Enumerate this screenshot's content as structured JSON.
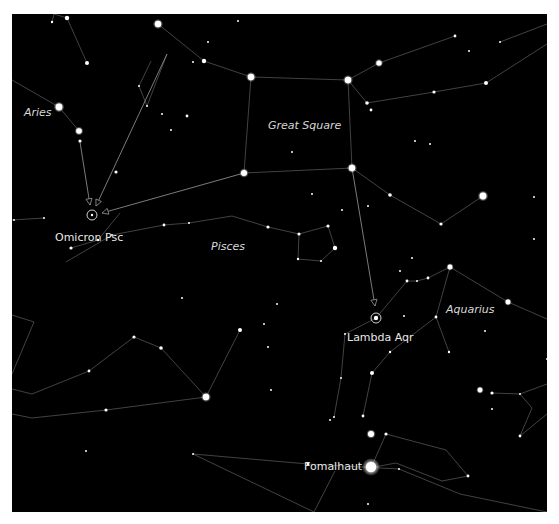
{
  "colors": {
    "background": "#000000",
    "frame": "#ffffff",
    "line": "#6e6e6e",
    "star": "#ffffff",
    "label": "#e6e6e6",
    "pointer": "#9a9a9a"
  },
  "labels": {
    "constellations": [
      {
        "id": "aries",
        "text": "Aries",
        "x": 24,
        "y": 107
      },
      {
        "id": "great-square",
        "text": "Great Square",
        "x": 256,
        "y": 106
      },
      {
        "id": "pisces",
        "text": "Pisces",
        "x": 199,
        "y": 227
      },
      {
        "id": "aquarius",
        "text": "Aquarius",
        "x": 434,
        "y": 290
      }
    ],
    "stars": [
      {
        "id": "omicron-psc",
        "text": "Omicron Psc",
        "x": 43,
        "y": 218
      },
      {
        "id": "lambda-aqr",
        "text": "Lambda Aqr",
        "x": 335,
        "y": 318
      },
      {
        "id": "fomalhaut",
        "text": "Fomalhaut",
        "x": 292,
        "y": 434
      }
    ]
  },
  "targets": [
    {
      "id": "omicron-psc",
      "x": 80,
      "y": 201
    },
    {
      "id": "lambda-aqr",
      "x": 364,
      "y": 304
    }
  ],
  "pointers": [
    {
      "from": [
        68,
        128
      ],
      "to": [
        78,
        191
      ]
    },
    {
      "from": [
        232,
        159
      ],
      "to": [
        90,
        199
      ]
    },
    {
      "from": [
        340,
        154
      ],
      "to": [
        363,
        292
      ]
    },
    {
      "from": [
        155,
        40
      ],
      "to": [
        84,
        192
      ]
    }
  ],
  "lines": [
    [
      [
        42,
        0
      ],
      [
        55,
        4
      ],
      [
        75,
        49
      ]
    ],
    [
      [
        42,
        0
      ],
      [
        40,
        8
      ]
    ],
    [
      [
        146,
        10
      ],
      [
        192,
        47
      ],
      [
        239,
        63
      ],
      [
        336,
        66
      ]
    ],
    [
      [
        336,
        66
      ],
      [
        367,
        49
      ],
      [
        443,
        22
      ]
    ],
    [
      [
        336,
        66
      ],
      [
        355,
        89
      ],
      [
        422,
        78
      ],
      [
        474,
        69
      ]
    ],
    [
      [
        474,
        69
      ],
      [
        535,
        30
      ]
    ],
    [
      [
        488,
        28
      ],
      [
        535,
        10
      ]
    ],
    [
      [
        239,
        63
      ],
      [
        232,
        159
      ]
    ],
    [
      [
        336,
        66
      ],
      [
        340,
        154
      ]
    ],
    [
      [
        232,
        159
      ],
      [
        340,
        154
      ]
    ],
    [
      [
        340,
        154
      ],
      [
        378,
        181
      ],
      [
        429,
        210
      ],
      [
        471,
        182
      ]
    ],
    [
      [
        0,
        66
      ],
      [
        47,
        93
      ],
      [
        67,
        117
      ]
    ],
    [
      [
        139,
        47
      ],
      [
        127,
        72
      ],
      [
        135,
        92
      ],
      [
        155,
        40
      ]
    ],
    [
      [
        0,
        206
      ],
      [
        32,
        204
      ]
    ],
    [
      [
        100,
        221
      ],
      [
        152,
        211
      ],
      [
        177,
        209
      ],
      [
        220,
        202
      ],
      [
        256,
        213
      ],
      [
        287,
        220
      ],
      [
        316,
        212
      ]
    ],
    [
      [
        287,
        220
      ],
      [
        286,
        245
      ],
      [
        309,
        247
      ],
      [
        323,
        234
      ],
      [
        316,
        212
      ]
    ],
    [
      [
        59,
        234
      ],
      [
        86,
        226
      ],
      [
        108,
        199
      ]
    ],
    [
      [
        100,
        221
      ],
      [
        54,
        248
      ]
    ],
    [
      [
        0,
        301
      ],
      [
        22,
        308
      ],
      [
        0,
        360
      ]
    ],
    [
      [
        0,
        375
      ],
      [
        20,
        380
      ],
      [
        77,
        357
      ],
      [
        122,
        323
      ],
      [
        149,
        334
      ],
      [
        194,
        383
      ],
      [
        228,
        316
      ]
    ],
    [
      [
        0,
        400
      ],
      [
        20,
        404
      ],
      [
        94,
        396
      ],
      [
        194,
        383
      ]
    ],
    [
      [
        364,
        304
      ],
      [
        395,
        267
      ],
      [
        405,
        267
      ],
      [
        416,
        264
      ],
      [
        438,
        253
      ],
      [
        496,
        288
      ],
      [
        535,
        305
      ]
    ],
    [
      [
        438,
        253
      ],
      [
        424,
        303
      ],
      [
        437,
        338
      ]
    ],
    [
      [
        424,
        303
      ],
      [
        378,
        338
      ],
      [
        360,
        359
      ],
      [
        351,
        402
      ]
    ],
    [
      [
        364,
        304
      ],
      [
        333,
        320
      ],
      [
        329,
        364
      ],
      [
        322,
        403
      ]
    ],
    [
      [
        508,
        380
      ],
      [
        535,
        370
      ]
    ],
    [
      [
        480,
        379
      ],
      [
        508,
        380
      ],
      [
        520,
        394
      ],
      [
        508,
        422
      ]
    ],
    [
      [
        508,
        422
      ],
      [
        535,
        400
      ]
    ],
    [
      [
        357,
        454
      ],
      [
        384,
        449
      ],
      [
        430,
        467
      ],
      [
        456,
        462
      ],
      [
        434,
        436
      ],
      [
        374,
        420
      ],
      [
        359,
        454
      ]
    ],
    [
      [
        181,
        440
      ],
      [
        296,
        450
      ],
      [
        387,
        455
      ],
      [
        448,
        480
      ],
      [
        535,
        498
      ]
    ],
    [
      [
        181,
        440
      ],
      [
        302,
        498
      ]
    ],
    [
      [
        302,
        498
      ],
      [
        323,
        457
      ]
    ]
  ],
  "stars": [
    {
      "x": 55,
      "y": 4,
      "r": 2.2
    },
    {
      "x": 146,
      "y": 10,
      "r": 3.2
    },
    {
      "x": 75,
      "y": 49,
      "r": 2.0
    },
    {
      "x": 40,
      "y": 8,
      "r": 1.2
    },
    {
      "x": 192,
      "y": 47,
      "r": 2.2
    },
    {
      "x": 239,
      "y": 63,
      "r": 3.2
    },
    {
      "x": 336,
      "y": 66,
      "r": 3.2
    },
    {
      "x": 367,
      "y": 49,
      "r": 2.6
    },
    {
      "x": 443,
      "y": 22,
      "r": 1.4
    },
    {
      "x": 355,
      "y": 89,
      "r": 1.8
    },
    {
      "x": 359,
      "y": 96,
      "r": 1.4
    },
    {
      "x": 422,
      "y": 78,
      "r": 1.6
    },
    {
      "x": 474,
      "y": 69,
      "r": 2.0
    },
    {
      "x": 488,
      "y": 28,
      "r": 1.0
    },
    {
      "x": 232,
      "y": 159,
      "r": 3.0
    },
    {
      "x": 340,
      "y": 154,
      "r": 3.2
    },
    {
      "x": 378,
      "y": 181,
      "r": 1.8
    },
    {
      "x": 429,
      "y": 210,
      "r": 1.6
    },
    {
      "x": 471,
      "y": 182,
      "r": 3.4
    },
    {
      "x": 47,
      "y": 93,
      "r": 3.4
    },
    {
      "x": 67,
      "y": 117,
      "r": 2.8
    },
    {
      "x": 68,
      "y": 127,
      "r": 1.6
    },
    {
      "x": 104,
      "y": 158,
      "r": 1.6
    },
    {
      "x": 127,
      "y": 72,
      "r": 1.0
    },
    {
      "x": 135,
      "y": 92,
      "r": 1.0
    },
    {
      "x": 150,
      "y": 100,
      "r": 1.0
    },
    {
      "x": 175,
      "y": 102,
      "r": 1.4
    },
    {
      "x": 159,
      "y": 116,
      "r": 1.0
    },
    {
      "x": 181,
      "y": 48,
      "r": 1.0
    },
    {
      "x": 226,
      "y": 7,
      "r": 1.0
    },
    {
      "x": 196,
      "y": 28,
      "r": 1.0
    },
    {
      "x": 152,
      "y": 211,
      "r": 1.4
    },
    {
      "x": 177,
      "y": 209,
      "r": 1.0
    },
    {
      "x": 256,
      "y": 213,
      "r": 1.6
    },
    {
      "x": 287,
      "y": 220,
      "r": 1.6
    },
    {
      "x": 316,
      "y": 212,
      "r": 1.6
    },
    {
      "x": 323,
      "y": 234,
      "r": 2.2
    },
    {
      "x": 286,
      "y": 245,
      "r": 1.2
    },
    {
      "x": 309,
      "y": 247,
      "r": 1.0
    },
    {
      "x": 86,
      "y": 226,
      "r": 1.2
    },
    {
      "x": 59,
      "y": 234,
      "r": 1.6
    },
    {
      "x": 32,
      "y": 204,
      "r": 1.0
    },
    {
      "x": 2,
      "y": 206,
      "r": 1.0
    },
    {
      "x": 100,
      "y": 221,
      "r": 1.0
    },
    {
      "x": 122,
      "y": 323,
      "r": 1.6
    },
    {
      "x": 149,
      "y": 334,
      "r": 1.8
    },
    {
      "x": 77,
      "y": 357,
      "r": 1.4
    },
    {
      "x": 194,
      "y": 383,
      "r": 3.2
    },
    {
      "x": 228,
      "y": 316,
      "r": 2.0
    },
    {
      "x": 94,
      "y": 396,
      "r": 1.6
    },
    {
      "x": 74,
      "y": 437,
      "r": 1.0
    },
    {
      "x": 170,
      "y": 284,
      "r": 1.0
    },
    {
      "x": 252,
      "y": 310,
      "r": 1.0
    },
    {
      "x": 256,
      "y": 333,
      "r": 1.0
    },
    {
      "x": 259,
      "y": 376,
      "r": 1.0
    },
    {
      "x": 265,
      "y": 290,
      "r": 1.0
    },
    {
      "x": 395,
      "y": 267,
      "r": 1.4
    },
    {
      "x": 405,
      "y": 267,
      "r": 1.0
    },
    {
      "x": 416,
      "y": 264,
      "r": 1.4
    },
    {
      "x": 438,
      "y": 253,
      "r": 2.4
    },
    {
      "x": 496,
      "y": 288,
      "r": 2.4
    },
    {
      "x": 424,
      "y": 303,
      "r": 1.4
    },
    {
      "x": 437,
      "y": 338,
      "r": 1.2
    },
    {
      "x": 378,
      "y": 338,
      "r": 1.2
    },
    {
      "x": 360,
      "y": 359,
      "r": 2.0
    },
    {
      "x": 351,
      "y": 402,
      "r": 1.4
    },
    {
      "x": 333,
      "y": 320,
      "r": 1.0
    },
    {
      "x": 329,
      "y": 364,
      "r": 1.0
    },
    {
      "x": 322,
      "y": 403,
      "r": 1.0
    },
    {
      "x": 318,
      "y": 406,
      "r": 1.0
    },
    {
      "x": 468,
      "y": 376,
      "r": 2.4
    },
    {
      "x": 480,
      "y": 379,
      "r": 1.6
    },
    {
      "x": 508,
      "y": 380,
      "r": 1.0
    },
    {
      "x": 508,
      "y": 422,
      "r": 1.4
    },
    {
      "x": 480,
      "y": 395,
      "r": 1.0
    },
    {
      "x": 535,
      "y": 345,
      "r": 1.0
    },
    {
      "x": 473,
      "y": 317,
      "r": 1.0
    },
    {
      "x": 388,
      "y": 257,
      "r": 1.0
    },
    {
      "x": 400,
      "y": 244,
      "r": 1.0
    },
    {
      "x": 392,
      "y": 302,
      "r": 1.0
    },
    {
      "x": 374,
      "y": 420,
      "r": 1.6
    },
    {
      "x": 359,
      "y": 420,
      "r": 3.0
    },
    {
      "x": 456,
      "y": 462,
      "r": 1.4
    },
    {
      "x": 296,
      "y": 450,
      "r": 1.4
    },
    {
      "x": 387,
      "y": 455,
      "r": 1.0
    },
    {
      "x": 181,
      "y": 440,
      "r": 1.0
    },
    {
      "x": 356,
      "y": 490,
      "r": 1.0
    },
    {
      "x": 540,
      "y": 440,
      "r": 1.0
    },
    {
      "x": 522,
      "y": 183,
      "r": 1.0
    },
    {
      "x": 418,
      "y": 130,
      "r": 1.0
    },
    {
      "x": 403,
      "y": 127,
      "r": 1.0
    },
    {
      "x": 300,
      "y": 180,
      "r": 1.0
    },
    {
      "x": 356,
      "y": 192,
      "r": 1.0
    },
    {
      "x": 330,
      "y": 196,
      "r": 1.0
    },
    {
      "x": 280,
      "y": 138,
      "r": 1.0
    },
    {
      "x": 457,
      "y": 37,
      "r": 1.0
    },
    {
      "x": 522,
      "y": 225,
      "r": 1.0
    }
  ],
  "star_labels_glow": [
    {
      "x": 359,
      "y": 453,
      "r": 5.2
    }
  ]
}
